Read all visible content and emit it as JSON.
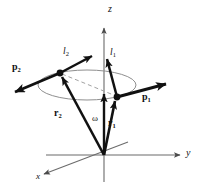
{
  "figure": {
    "name": "angular-momentum-two-particle-diagram",
    "type": "physics-vector-diagram",
    "background_color": "#ffffff",
    "axes": {
      "z": {
        "label": "z",
        "tip": [
          104,
          22
        ],
        "origin": [
          104,
          182
        ]
      },
      "y": {
        "label": "y",
        "tip": [
          186,
          155
        ],
        "origin": [
          104,
          155
        ]
      },
      "x": {
        "label": "x",
        "tip": [
          40,
          176
        ],
        "origin": [
          104,
          155
        ]
      },
      "axis_color": "#6b6b6b"
    },
    "orbit": {
      "name": "circular-orbit-ellipse",
      "center": [
        87,
        85
      ],
      "rx": 49,
      "ry": 15,
      "color": "#8a8a8a"
    },
    "particles": [
      {
        "name": "particle-1-dot",
        "at": [
          117,
          97
        ]
      },
      {
        "name": "particle-2-dot",
        "at": [
          60,
          73
        ]
      }
    ],
    "dashed_chord": {
      "name": "diameter-dashed-line",
      "from": [
        60,
        73
      ],
      "to": [
        117,
        97
      ],
      "color": "#9a9a9a"
    },
    "vectors": [
      {
        "name": "momentum-p1",
        "label": "p",
        "subscript": "1",
        "from": [
          117,
          97
        ],
        "to": [
          172,
          82
        ],
        "label_at": [
          146,
          97
        ]
      },
      {
        "name": "momentum-p2",
        "label": "p",
        "subscript": "2",
        "from": [
          60,
          73
        ],
        "to": [
          8,
          95
        ],
        "label_at": [
          18,
          66
        ]
      },
      {
        "name": "angular-momentum-l1",
        "label": "l",
        "subscript": "1",
        "from": [
          117,
          97
        ],
        "to": [
          106,
          54
        ],
        "label_at": [
          109,
          55
        ]
      },
      {
        "name": "angular-momentum-l2",
        "label": "l",
        "subscript": "2",
        "from": [
          60,
          73
        ],
        "to": [
          97,
          53
        ],
        "label_at": [
          66,
          54
        ]
      },
      {
        "name": "position-r1",
        "label": "r",
        "subscript": "1",
        "from": [
          104,
          155
        ],
        "to": [
          117,
          97
        ],
        "label_at": [
          109,
          122
        ]
      },
      {
        "name": "position-r2",
        "label": "r",
        "subscript": "2",
        "from": [
          104,
          155
        ],
        "to": [
          60,
          73
        ],
        "label_at": [
          58,
          113
        ]
      },
      {
        "name": "angular-velocity-omega",
        "label": "ω",
        "subscript": "",
        "from": [
          104,
          155
        ],
        "to": [
          104,
          90
        ],
        "label_at": [
          93,
          120
        ]
      }
    ],
    "labels": {
      "p1": "p",
      "p1_sub": "1",
      "p2": "p",
      "p2_sub": "2",
      "l1": "l",
      "l1_sub": "1",
      "l2": "l",
      "l2_sub": "2",
      "r1": "r",
      "r1_sub": "1",
      "r2": "r",
      "r2_sub": "2",
      "omega": "ω",
      "x": "x",
      "y": "y",
      "z": "z"
    }
  }
}
